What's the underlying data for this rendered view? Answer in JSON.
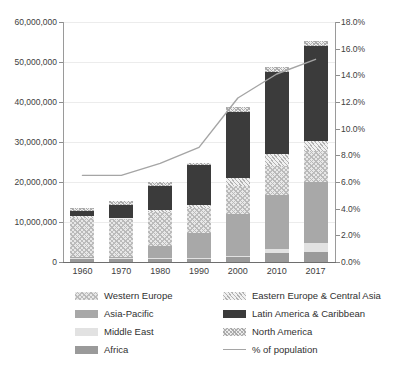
{
  "chart_data": {
    "type": "bar",
    "subtype": "stacked-bar-with-line",
    "title": "",
    "xlabel": "",
    "ylabel": "",
    "categories": [
      "1960",
      "1970",
      "1980",
      "1990",
      "2000",
      "2010",
      "2017"
    ],
    "ylim": [
      0,
      60000000
    ],
    "ytick_values": [
      0,
      10000000,
      20000000,
      30000000,
      40000000,
      50000000,
      60000000
    ],
    "ytick_labels": [
      "0",
      "10,000,000",
      "20,000,000",
      "30,000,000",
      "40,000,000",
      "50,000,000",
      "60,000,000"
    ],
    "y2lim": [
      0,
      18
    ],
    "y2tick_values": [
      0,
      2,
      4,
      6,
      8,
      10,
      12,
      14,
      16,
      18
    ],
    "y2tick_labels": [
      "0.0%",
      "2.0%",
      "4.0%",
      "6.0%",
      "8.0%",
      "10.0%",
      "12.0%",
      "14.0%",
      "16.0%",
      "18.0%"
    ],
    "grid": true,
    "legend_position": "bottom",
    "stack_order_bottom_to_top": [
      "Africa",
      "Middle East",
      "Asia-Pacific",
      "Western Europe",
      "Eastern Europe & Central Asia",
      "Latin America & Caribbean",
      "North America"
    ],
    "series": [
      {
        "name": "Africa",
        "key": "africa",
        "color": "#9a9a9a",
        "pattern": "solid",
        "values": [
          700000,
          700000,
          800000,
          700000,
          1200000,
          2200000,
          2400000
        ]
      },
      {
        "name": "Middle East",
        "key": "mideast",
        "color": "#e2e2e2",
        "pattern": "solid",
        "values": [
          400000,
          300000,
          300000,
          300000,
          400000,
          1000000,
          2300000
        ]
      },
      {
        "name": "Asia-Pacific",
        "key": "asiapac",
        "color": "#a8a8a8",
        "pattern": "solid",
        "values": [
          100000,
          300000,
          2800000,
          6200000,
          10300000,
          13500000,
          15300000
        ]
      },
      {
        "name": "Western Europe",
        "key": "westeur",
        "color": "#e8e8e8",
        "pattern": "cross-hatch",
        "values": [
          9900000,
          9600000,
          8700000,
          6200000,
          7100000,
          7200000,
          7800000
        ]
      },
      {
        "name": "Eastern Europe & Central Asia",
        "key": "easteur",
        "color": "#f0f0f0",
        "pattern": "diagonal",
        "values": [
          300000,
          200000,
          300000,
          900000,
          2000000,
          3000000,
          2400000
        ]
      },
      {
        "name": "Latin America & Caribbean",
        "key": "latam",
        "color": "#3b3b3b",
        "pattern": "solid",
        "values": [
          1400000,
          3100000,
          6100000,
          9900000,
          16400000,
          20700000,
          23700000
        ]
      },
      {
        "name": "North America",
        "key": "northam",
        "color": "#ededed",
        "pattern": "cross-hatch",
        "values": [
          700000,
          1000000,
          1000000,
          600000,
          1300000,
          1200000,
          1300000
        ]
      }
    ],
    "totals": [
      13500000,
      15200000,
      20000000,
      24800000,
      38700000,
      48800000,
      55200000
    ],
    "line_series": {
      "name": "% of population",
      "color": "#a5a5a5",
      "axis": "right",
      "unit": "%",
      "values": [
        6.5,
        6.5,
        7.4,
        8.6,
        12.3,
        14.1,
        15.2
      ]
    }
  },
  "legend": {
    "items": [
      {
        "label": "Western Europe",
        "swatch": "swatch-western-europe"
      },
      {
        "label": "Eastern Europe & Central Asia",
        "swatch": "swatch-eastern-europe-central-asia"
      },
      {
        "label": "Asia-Pacific",
        "swatch": "swatch-asia-pacific"
      },
      {
        "label": "Latin America & Caribbean",
        "swatch": "swatch-latin-america-caribbean"
      },
      {
        "label": "Middle East",
        "swatch": "swatch-middle-east"
      },
      {
        "label": "North America",
        "swatch": "swatch-north-america"
      },
      {
        "label": "Africa",
        "swatch": "swatch-africa"
      },
      {
        "label": "% of population",
        "swatch": "swatch-percent-of-population"
      }
    ]
  }
}
